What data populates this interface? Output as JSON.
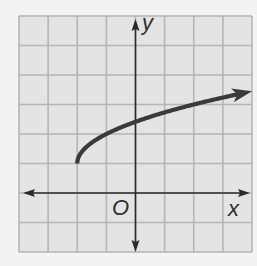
{
  "chart_data": {
    "type": "line",
    "title": "",
    "function": "y = sqrt(x + 2) + 1",
    "xlabel": "x",
    "ylabel": "y",
    "origin_label": "O",
    "xlim": [
      -4,
      4
    ],
    "ylim": [
      -2,
      6
    ],
    "grid": true,
    "grid_step": 1,
    "tick_labels": false,
    "legend": null,
    "series": [
      {
        "name": "curve",
        "start_point": [
          -2,
          1
        ],
        "start_closed_endpoint": true,
        "end_arrow": true,
        "x": [
          -2,
          -1.75,
          -1.5,
          -1,
          -0.5,
          0,
          1,
          2,
          3,
          4
        ],
        "y": [
          1,
          1.5,
          1.71,
          2,
          2.58,
          2.41,
          2.73,
          3,
          3.24,
          3.45
        ]
      }
    ],
    "colors": {
      "page_background": "#f3f3f3",
      "grid_background": "#e4e4e4",
      "grid_lines": "#b5b5b5",
      "axes": "#2b2b2b",
      "curve": "#3a3a3a"
    }
  },
  "labels": {
    "x": "x",
    "y": "y",
    "origin": "O"
  }
}
